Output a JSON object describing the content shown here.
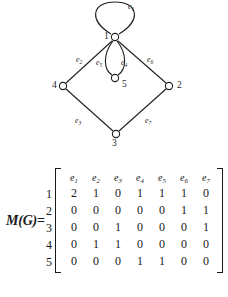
{
  "figure": {
    "graph": {
      "vertices": [
        {
          "id": "1",
          "label": "1",
          "cx": 115,
          "cy": 37,
          "label_x": 104,
          "label_y": 32
        },
        {
          "id": "2",
          "label": "2",
          "cx": 169,
          "cy": 86,
          "label_x": 177,
          "label_y": 81
        },
        {
          "id": "3",
          "label": "3",
          "cx": 116,
          "cy": 134,
          "label_x": 112,
          "label_y": 140
        },
        {
          "id": "4",
          "label": "4",
          "cx": 63,
          "cy": 86,
          "label_x": 52,
          "label_y": 81
        },
        {
          "id": "5",
          "label": "5",
          "cx": 115,
          "cy": 78,
          "label_x": 122,
          "label_y": 80
        }
      ],
      "edges": [
        {
          "id": "e1",
          "label": "e",
          "sub": "1",
          "from": "1",
          "to": "1",
          "kind": "loop",
          "label_x": 128,
          "label_y": 3
        },
        {
          "id": "e2",
          "label": "e",
          "sub": "2",
          "from": "1",
          "to": "4",
          "kind": "straight",
          "label_x": 76,
          "label_y": 56
        },
        {
          "id": "e3",
          "label": "e",
          "sub": "3",
          "from": "4",
          "to": "3",
          "kind": "straight",
          "label_x": 75,
          "label_y": 117
        },
        {
          "id": "e4",
          "label": "e",
          "sub": "4",
          "from": "1",
          "to": "5",
          "kind": "curve-right",
          "label_x": 121,
          "label_y": 59
        },
        {
          "id": "e5",
          "label": "e",
          "sub": "5",
          "from": "1",
          "to": "5",
          "kind": "curve-left",
          "label_x": 98,
          "label_y": 59
        },
        {
          "id": "e6",
          "label": "e",
          "sub": "6",
          "from": "1",
          "to": "2",
          "kind": "straight",
          "label_x": 147,
          "label_y": 56
        },
        {
          "id": "e7",
          "label": "e",
          "sub": "7",
          "from": "3",
          "to": "2",
          "kind": "straight",
          "label_x": 145,
          "label_y": 117
        }
      ]
    },
    "matrix": {
      "lhs": "M(G)",
      "equals": "=",
      "column_headers": [
        {
          "label": "e",
          "sub": "1"
        },
        {
          "label": "e",
          "sub": "2"
        },
        {
          "label": "e",
          "sub": "3"
        },
        {
          "label": "e",
          "sub": "4"
        },
        {
          "label": "e",
          "sub": "5"
        },
        {
          "label": "e",
          "sub": "6"
        },
        {
          "label": "e",
          "sub": "7"
        }
      ],
      "row_labels": [
        "1",
        "2",
        "3",
        "4",
        "5"
      ],
      "rows": [
        [
          "2",
          "1",
          "0",
          "1",
          "1",
          "1",
          "0"
        ],
        [
          "0",
          "0",
          "0",
          "0",
          "0",
          "1",
          "1"
        ],
        [
          "0",
          "0",
          "1",
          "0",
          "0",
          "0",
          "1"
        ],
        [
          "0",
          "1",
          "1",
          "0",
          "0",
          "0",
          "0"
        ],
        [
          "0",
          "0",
          "0",
          "1",
          "1",
          "0",
          "0"
        ]
      ]
    },
    "caption": ""
  },
  "colors": {
    "ink": "#1a1a1a",
    "paper": "#ffffff",
    "caption": "#8d8d8d"
  }
}
